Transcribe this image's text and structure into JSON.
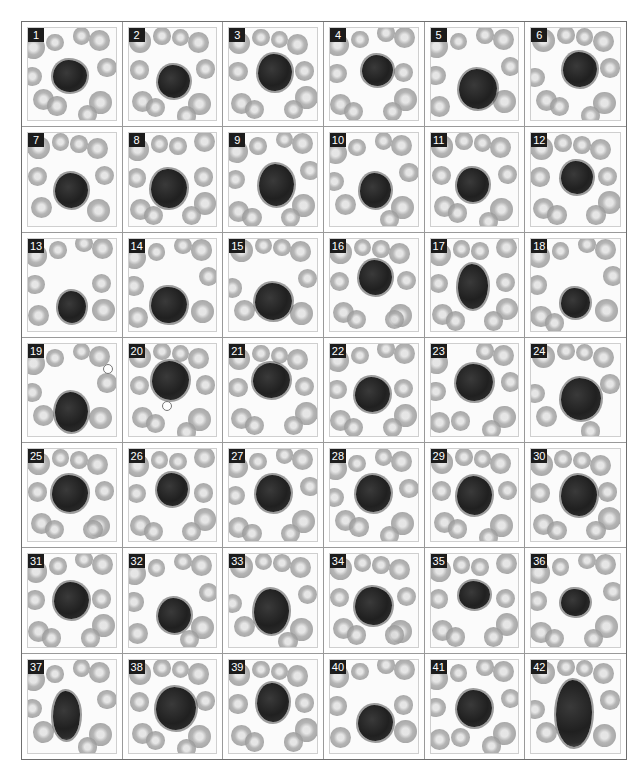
{
  "figure": {
    "colors": {
      "border": "#6e6e6e",
      "label_bg": "#1c1c1c",
      "label_fg": "#ffffff",
      "nucleus": "#222222",
      "rbc": "#a9a9a9"
    },
    "layout": {
      "columns": 6,
      "rows": 7
    },
    "panels": [
      {
        "label": "1",
        "cx": 48,
        "cy": 52,
        "w": 38,
        "h": 34
      },
      {
        "label": "2",
        "cx": 52,
        "cy": 58,
        "w": 36,
        "h": 36
      },
      {
        "label": "3",
        "cx": 52,
        "cy": 48,
        "w": 38,
        "h": 40
      },
      {
        "label": "4",
        "cx": 54,
        "cy": 46,
        "w": 36,
        "h": 34
      },
      {
        "label": "5",
        "cx": 54,
        "cy": 66,
        "w": 44,
        "h": 44
      },
      {
        "label": "6",
        "cx": 55,
        "cy": 45,
        "w": 38,
        "h": 38
      },
      {
        "label": "7",
        "cx": 50,
        "cy": 62,
        "w": 38,
        "h": 38
      },
      {
        "label": "8",
        "cx": 46,
        "cy": 60,
        "w": 40,
        "h": 42
      },
      {
        "label": "9",
        "cx": 54,
        "cy": 56,
        "w": 40,
        "h": 46
      },
      {
        "label": "10",
        "cx": 52,
        "cy": 62,
        "w": 36,
        "h": 38
      },
      {
        "label": "11",
        "cx": 48,
        "cy": 56,
        "w": 36,
        "h": 36
      },
      {
        "label": "12",
        "cx": 52,
        "cy": 48,
        "w": 36,
        "h": 36
      },
      {
        "label": "13",
        "cx": 50,
        "cy": 74,
        "w": 32,
        "h": 34
      },
      {
        "label": "14",
        "cx": 46,
        "cy": 72,
        "w": 40,
        "h": 40
      },
      {
        "label": "15",
        "cx": 50,
        "cy": 68,
        "w": 42,
        "h": 40
      },
      {
        "label": "16",
        "cx": 52,
        "cy": 42,
        "w": 38,
        "h": 38
      },
      {
        "label": "17",
        "cx": 48,
        "cy": 52,
        "w": 34,
        "h": 48
      },
      {
        "label": "18",
        "cx": 50,
        "cy": 70,
        "w": 32,
        "h": 32
      },
      {
        "label": "19",
        "cx": 50,
        "cy": 74,
        "w": 38,
        "h": 44,
        "artifact": {
          "x": 86,
          "y": 22
        }
      },
      {
        "label": "20",
        "cx": 48,
        "cy": 40,
        "w": 42,
        "h": 42,
        "artifact": {
          "x": 38,
          "y": 62
        }
      },
      {
        "label": "21",
        "cx": 48,
        "cy": 40,
        "w": 42,
        "h": 38
      },
      {
        "label": "22",
        "cx": 48,
        "cy": 55,
        "w": 40,
        "h": 38
      },
      {
        "label": "23",
        "cx": 50,
        "cy": 42,
        "w": 42,
        "h": 40
      },
      {
        "label": "24",
        "cx": 56,
        "cy": 60,
        "w": 46,
        "h": 46
      },
      {
        "label": "25",
        "cx": 48,
        "cy": 48,
        "w": 42,
        "h": 40
      },
      {
        "label": "26",
        "cx": 50,
        "cy": 44,
        "w": 36,
        "h": 36
      },
      {
        "label": "27",
        "cx": 50,
        "cy": 48,
        "w": 40,
        "h": 40
      },
      {
        "label": "28",
        "cx": 50,
        "cy": 48,
        "w": 40,
        "h": 40
      },
      {
        "label": "29",
        "cx": 50,
        "cy": 50,
        "w": 40,
        "h": 42
      },
      {
        "label": "30",
        "cx": 54,
        "cy": 50,
        "w": 40,
        "h": 44
      },
      {
        "label": "31",
        "cx": 50,
        "cy": 50,
        "w": 40,
        "h": 40
      },
      {
        "label": "32",
        "cx": 52,
        "cy": 66,
        "w": 38,
        "h": 38
      },
      {
        "label": "33",
        "cx": 48,
        "cy": 62,
        "w": 40,
        "h": 48
      },
      {
        "label": "34",
        "cx": 50,
        "cy": 56,
        "w": 42,
        "h": 42
      },
      {
        "label": "35",
        "cx": 50,
        "cy": 44,
        "w": 36,
        "h": 30
      },
      {
        "label": "36",
        "cx": 50,
        "cy": 52,
        "w": 32,
        "h": 30
      },
      {
        "label": "37",
        "cx": 44,
        "cy": 60,
        "w": 30,
        "h": 52
      },
      {
        "label": "38",
        "cx": 54,
        "cy": 52,
        "w": 46,
        "h": 46
      },
      {
        "label": "39",
        "cx": 50,
        "cy": 46,
        "w": 36,
        "h": 42
      },
      {
        "label": "40",
        "cx": 52,
        "cy": 68,
        "w": 40,
        "h": 38
      },
      {
        "label": "41",
        "cx": 50,
        "cy": 52,
        "w": 40,
        "h": 40
      },
      {
        "label": "42",
        "cx": 48,
        "cy": 58,
        "w": 40,
        "h": 72
      }
    ]
  }
}
